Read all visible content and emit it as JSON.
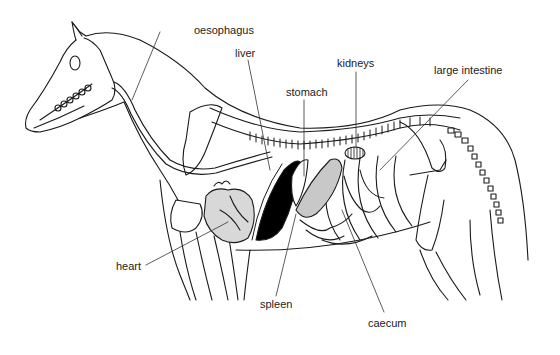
{
  "diagram": {
    "style": "black line drawing on white",
    "colors": {
      "line": "#1a1a1a",
      "fill_dark": "#000000",
      "background": "#ffffff"
    }
  },
  "labels": {
    "oesophagus": "oesophagus",
    "liver": "liver",
    "stomach": "stomach",
    "kidneys": "kidneys",
    "large_intestine": "large intestine",
    "heart": "heart",
    "spleen": "spleen",
    "caecum": "caecum"
  }
}
